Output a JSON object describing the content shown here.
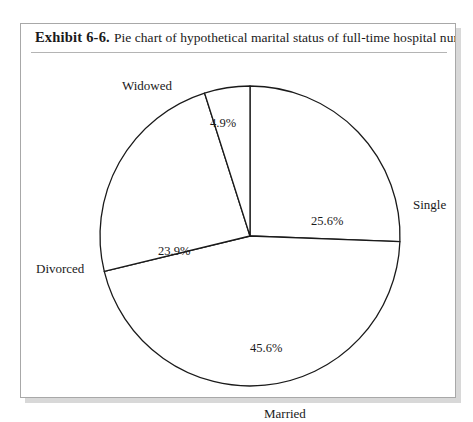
{
  "page": {
    "clipped_top_line": "",
    "background_color": "#ffffff"
  },
  "exhibit": {
    "number_label": "Exhibit 6-6.",
    "caption": "Pie chart of hypothetical marital status of full-time hospital nurses.",
    "border_color": "#a8a8a8"
  },
  "chart_data": {
    "type": "pie",
    "title": "Pie chart of hypothetical marital status of full-time hospital nurses.",
    "categories": [
      "Single",
      "Married",
      "Divorced",
      "Widowed"
    ],
    "values": [
      25.6,
      45.6,
      23.9,
      4.9
    ],
    "value_labels": [
      "25.6%",
      "45.6%",
      "23.9%",
      "4.9%"
    ],
    "unit": "percent",
    "start_angle_deg": 0,
    "direction": "clockwise",
    "legend": "none",
    "slice_fill": "#ffffff",
    "slice_stroke": "#1a1a1a",
    "geometry": {
      "center_x": 229,
      "center_y": 183,
      "radius": 150
    },
    "slices": [
      {
        "name": "Single",
        "value": 25.6,
        "value_label": "25.6%",
        "label": "Single",
        "label_x": 392,
        "label_y": 144,
        "pct_x": 290,
        "pct_y": 161
      },
      {
        "name": "Married",
        "value": 45.6,
        "value_label": "45.6%",
        "label": "Married",
        "label_x": 243,
        "label_y": 353,
        "pct_x": 229,
        "pct_y": 288
      },
      {
        "name": "Divorced",
        "value": 23.9,
        "value_label": "23.9%",
        "label": "Divorced",
        "label_x": 15,
        "label_y": 208,
        "pct_x": 137,
        "pct_y": 191
      },
      {
        "name": "Widowed",
        "value": 4.9,
        "value_label": "4.9%",
        "label": "Widowed",
        "label_x": 101,
        "label_y": 25,
        "pct_x": 189,
        "pct_y": 63
      }
    ]
  }
}
